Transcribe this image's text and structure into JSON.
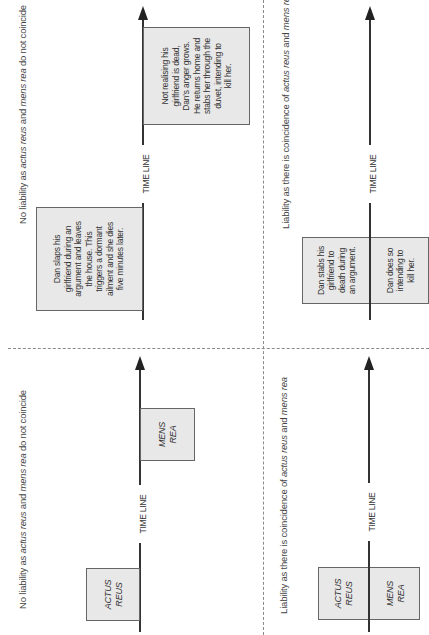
{
  "panels": {
    "top_left": {
      "caption_prefix": "No liability as ",
      "caption_term1": "actus reus",
      "caption_mid": " and ",
      "caption_term2": "mens rea",
      "caption_suffix": " do not coincide",
      "timeline_label": "TIME LINE",
      "box_1_text": "Dan slaps his\ngirlfriend during an\nargument and leaves\nthe house. This\ntriggers a dormant\nailment and she dies\nfive minutes later.",
      "box_2_text": "Not realising his\ngirlfriend is dead,\nDan's anger grows.\nHe returns home and\nstabs her through the\nduvet, intending to\nkill her."
    },
    "top_right": {
      "caption_prefix": "Liability as there is coincidence of ",
      "caption_term1": "actus reus",
      "caption_mid": " and ",
      "caption_term2": "mens rea",
      "timeline_label": "TIME LINE",
      "box_left_text": "Dan stabs his\ngirlfriend to\ndeath during\nan argument.",
      "box_right_text": "Dan does so\nintending to\nkill her."
    },
    "bottom_left": {
      "caption_prefix": "No liability as ",
      "caption_term1": "actus reus",
      "caption_mid": " and ",
      "caption_term2": "mens rea",
      "caption_suffix": " do not coincide",
      "timeline_label": "TIME LINE",
      "box_1_text": "ACTUS\nREUS",
      "box_2_text": "MENS\nREA"
    },
    "bottom_right": {
      "caption_prefix": "Liability as there is coincidence of ",
      "caption_term1": "actus reus",
      "caption_mid": " and ",
      "caption_term2": "mens rea",
      "timeline_label": "TIME LINE",
      "box_left_text": "ACTUS\nREUS",
      "box_right_text": "MENS\nREA"
    }
  },
  "colors": {
    "box_fill": "#e8e8e8",
    "box_border": "#666666",
    "axis": "#333333",
    "divider": "#8a8a8a"
  }
}
